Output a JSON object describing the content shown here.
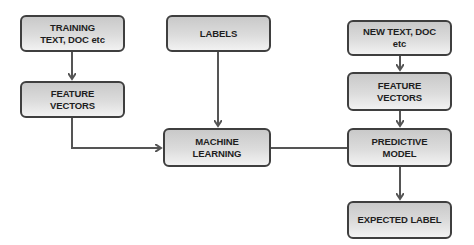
{
  "diagram": {
    "type": "flowchart",
    "nodes": {
      "training": {
        "line1": "TRAINING",
        "line2": "TEXT, DOC etc"
      },
      "feature_left": {
        "line1": "FEATURE",
        "line2": "VECTORS"
      },
      "labels": {
        "line1": "LABELS"
      },
      "machine_learning": {
        "line1": "MACHINE",
        "line2": "LEARNING"
      },
      "new_text": {
        "line1": "NEW TEXT, DOC",
        "line2": "etc"
      },
      "feature_right": {
        "line1": "FEATURE",
        "line2": "VECTORS"
      },
      "predictive_model": {
        "line1": "PREDICTIVE",
        "line2": "MODEL"
      },
      "expected_label": {
        "line1": "EXPECTED LABEL"
      }
    },
    "edges": [
      {
        "from": "training",
        "to": "feature_left",
        "arrow": true
      },
      {
        "from": "feature_left",
        "to": "machine_learning",
        "arrow": true
      },
      {
        "from": "labels",
        "to": "machine_learning",
        "arrow": true
      },
      {
        "from": "machine_learning",
        "to": "predictive_model",
        "arrow": false
      },
      {
        "from": "new_text",
        "to": "feature_right",
        "arrow": true
      },
      {
        "from": "feature_right",
        "to": "predictive_model",
        "arrow": true
      },
      {
        "from": "predictive_model",
        "to": "expected_label",
        "arrow": true
      }
    ],
    "colors": {
      "border": "#3f3f3f",
      "fill_top": "#c9c9c9",
      "fill_bottom": "#f2f2f2",
      "connector": "#555555",
      "text": "#1e1e1e"
    }
  }
}
